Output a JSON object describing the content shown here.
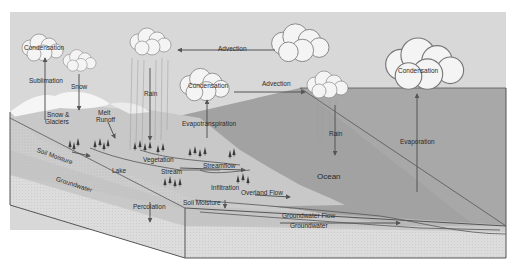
{
  "diagram": {
    "colors": {
      "sky": "#d6d6d6",
      "ocean": "#9e9e9e",
      "land_top": "#c4c4c4",
      "soil": "#cfcfcf",
      "groundwater": "#bdbdbd",
      "front_face": "#e2e2e2",
      "outline": "#555555",
      "arrow": "#555555",
      "cloud": "#f4f4f4"
    },
    "labels": {
      "condensation_left": "Condensation",
      "sublimation": "Sublimation",
      "snow": "Snow",
      "snow_glaciers_1": "Snow &",
      "snow_glaciers_2": "Glaciers",
      "melt_runoff_1": "Melt",
      "melt_runoff_2": "Runoff",
      "rain_left": "Rain",
      "advection_top": "Advection",
      "condensation_middle": "Condensation",
      "advection_middle": "Advection",
      "evapotranspiration": "Evapotranspiration",
      "rain_right": "Rain",
      "condensation_right": "Condensation",
      "evaporation": "Evaporation",
      "ocean": "Ocean",
      "soil_moisture_upper": "Soil Moisture",
      "groundwater_upper": "Groundwater",
      "lake": "Lake",
      "vegetation": "Vegetation",
      "stream": "Stream",
      "streamflow": "Streamflow",
      "infiltration": "Infiltration",
      "overland_flow": "Overland Flow",
      "soil_moisture_lower": "Soil Moisture",
      "percolation": "Percolation",
      "groundwater_flow": "Groundwater Flow",
      "groundwater_lower": "Groundwater"
    }
  }
}
